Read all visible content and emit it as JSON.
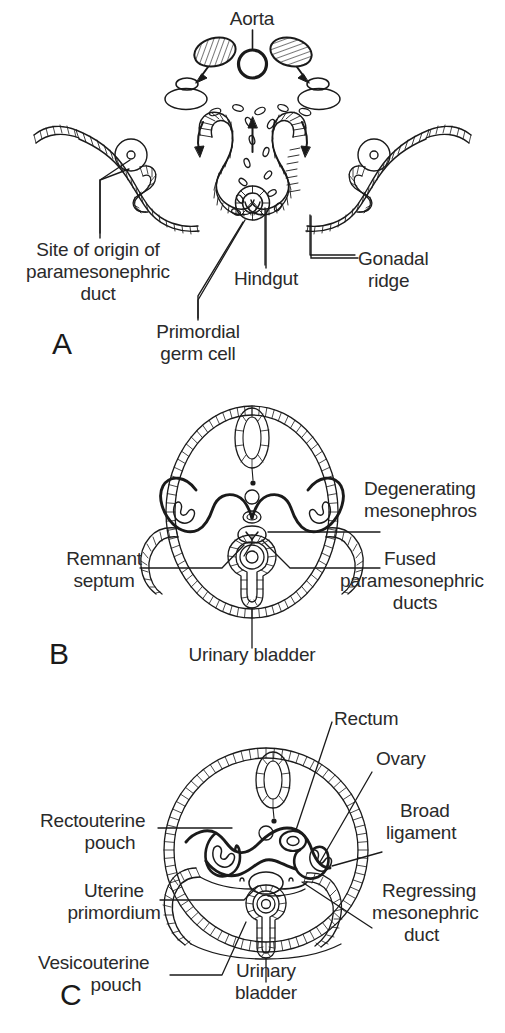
{
  "figure": {
    "background_color": "#ffffff",
    "line_color": "#1a1a1a",
    "text_color": "#2a2a2a"
  },
  "panels": [
    {
      "letter": "A",
      "caption_letter": "A",
      "labels": [
        {
          "id": "aorta",
          "text": "Aorta"
        },
        {
          "id": "site-origin",
          "text": "Site of origin of\nparamesonephric\nduct"
        },
        {
          "id": "primordial",
          "text": "Primordial\ngerm cell"
        },
        {
          "id": "hindgut",
          "text": "Hindgut"
        },
        {
          "id": "gonadal",
          "text": "Gonadal\nridge"
        }
      ]
    },
    {
      "letter": "B",
      "caption_letter": "B",
      "labels": [
        {
          "id": "degenerating",
          "text": "Degenerating\nmesonephros"
        },
        {
          "id": "fused",
          "text": "Fused\nparamesonephric\nducts"
        },
        {
          "id": "remnant",
          "text": "Remnant\nseptum"
        },
        {
          "id": "bladder-b",
          "text": "Urinary bladder"
        }
      ]
    },
    {
      "letter": "C",
      "caption_letter": "C",
      "labels": [
        {
          "id": "rectum",
          "text": "Rectum"
        },
        {
          "id": "ovary",
          "text": "Ovary"
        },
        {
          "id": "broad",
          "text": "Broad\nligament"
        },
        {
          "id": "regressing",
          "text": "Regressing\nmesonephric\nduct"
        },
        {
          "id": "rectouterine",
          "text": "Rectouterine\npouch"
        },
        {
          "id": "uterine",
          "text": "Uterine\nprimordium"
        },
        {
          "id": "vesico",
          "text": "Vesicouterine\npouch"
        },
        {
          "id": "bladder-c",
          "text": "Urinary\nbladder"
        }
      ]
    }
  ],
  "label_text": {
    "aorta": "Aorta",
    "site_of_origin_1": "Site of origin of",
    "site_of_origin_2": "paramesonephric",
    "site_of_origin_3": "duct",
    "primordial_1": "Primordial",
    "primordial_2": "germ cell",
    "hindgut": "Hindgut",
    "gonadal_1": "Gonadal",
    "gonadal_2": "ridge",
    "panel_a": "A",
    "degenerating_1": "Degenerating",
    "degenerating_2": "mesonephros",
    "fused_1": "Fused",
    "fused_2": "paramesonephric",
    "fused_3": "ducts",
    "remnant_1": "Remnant",
    "remnant_2": "septum",
    "urinary_bladder_b": "Urinary bladder",
    "panel_b": "B",
    "rectum": "Rectum",
    "ovary": "Ovary",
    "broad_1": "Broad",
    "broad_2": "ligament",
    "regressing_1": "Regressing",
    "regressing_2": "mesonephric",
    "regressing_3": "duct",
    "rectouterine_1": "Rectouterine",
    "rectouterine_2": "pouch",
    "uterine_1": "Uterine",
    "uterine_2": "primordium",
    "vesico_1": "Vesicouterine",
    "vesico_2": "pouch",
    "urinary_c_1": "Urinary",
    "urinary_c_2": "bladder",
    "panel_c": "C"
  },
  "structures": {
    "panel_a": [
      "aorta-lumen",
      "mesonephros-hatched-left",
      "mesonephros-hatched-right",
      "gonadal-ridge-left",
      "gonadal-ridge-right",
      "migrating-germ-cells",
      "hindgut",
      "coelomic-epithelium",
      "mesonephric-duct-left",
      "mesonephric-duct-right",
      "mesonephric-tubule-left",
      "mesonephric-tubule-right",
      "paramesonephric-funnel-left",
      "paramesonephric-funnel-right",
      "migration-arrow-left",
      "migration-arrow-right",
      "migration-arrow-center"
    ],
    "panel_b": [
      "body-wall-oval",
      "neural-tube",
      "degenerating-mesonephros-left",
      "degenerating-mesonephros-right",
      "rectum",
      "fused-paramesonephric-ducts",
      "remnant-septum",
      "urinary-bladder",
      "peritoneal-folds"
    ],
    "panel_c": [
      "body-wall-circle",
      "neural-tube",
      "rectum",
      "ovary-left",
      "ovary-right",
      "broad-ligament",
      "regressing-mesonephric-duct",
      "rectouterine-pouch",
      "uterine-primordium",
      "vesicouterine-pouch",
      "urinary-bladder"
    ]
  }
}
